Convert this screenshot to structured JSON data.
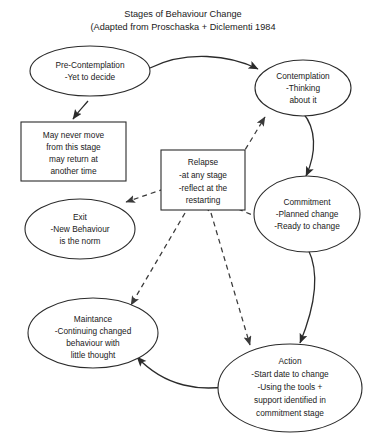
{
  "header": {
    "title": "Stages of Behaviour Change",
    "subtitle": "(Adapted from Proschaska + Diclementi 1984"
  },
  "colors": {
    "background": "#ffffff",
    "stroke": "#2b2b2b",
    "text": "#1a1a1a",
    "dashed_stroke": "#3a3a3a"
  },
  "nodes": {
    "pre_contemplation": {
      "shape": "ellipse",
      "line1": "Pre-Contemplation",
      "line2": "-Yet to decide"
    },
    "contemplation": {
      "shape": "ellipse",
      "line1": "Contemplation",
      "line2": "-Thinking",
      "line3": "about it"
    },
    "may_never_move": {
      "shape": "rectangle",
      "line1": "May never move",
      "line2": "from this stage",
      "line3": "may return at",
      "line4": "another time"
    },
    "relapse": {
      "shape": "rectangle",
      "line1": "Relapse",
      "line2": "-at any stage",
      "line3": "-reflect at the",
      "line4": "restarting"
    },
    "commitment": {
      "shape": "ellipse",
      "line1": "Commitment",
      "line2": "-Planned change",
      "line3": "-Ready to change"
    },
    "exit": {
      "shape": "ellipse",
      "line1": "Exit",
      "line2": "-New Behaviour",
      "line3": "is the norm"
    },
    "maintance": {
      "shape": "ellipse",
      "line1": "Maintance",
      "line2": "-Continuing changed",
      "line3": "behaviour with",
      "line4": "little thought"
    },
    "action": {
      "shape": "ellipse",
      "line1": "Action",
      "line2": "-Start date to change",
      "line3": "-Using the tools +",
      "line4": "support identified in",
      "line5": "commitment stage"
    }
  },
  "edges": [
    {
      "name": "pre-contemplation-to-contemplation",
      "style": "solid"
    },
    {
      "name": "pre-contemplation-to-may-never-move",
      "style": "solid"
    },
    {
      "name": "contemplation-to-commitment",
      "style": "solid"
    },
    {
      "name": "commitment-to-action",
      "style": "solid"
    },
    {
      "name": "action-to-maintance",
      "style": "solid"
    },
    {
      "name": "relapse-to-contemplation",
      "style": "dashed"
    },
    {
      "name": "relapse-to-exit",
      "style": "dashed"
    },
    {
      "name": "relapse-to-commitment",
      "style": "dashed"
    },
    {
      "name": "relapse-to-maintance",
      "style": "dashed"
    },
    {
      "name": "relapse-to-action",
      "style": "dashed"
    }
  ]
}
